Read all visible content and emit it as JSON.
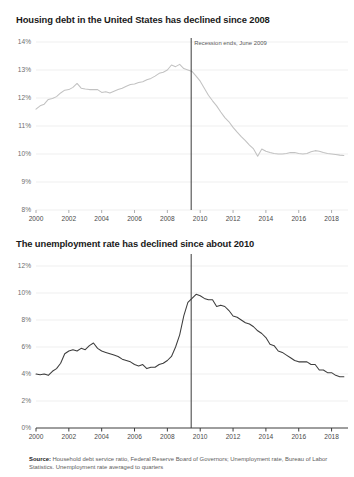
{
  "chart_data": [
    {
      "type": "line",
      "title": "Housing debt in the United States has declined since 2008",
      "xlabel": "",
      "ylabel": "",
      "xlim": [
        2000,
        2019
      ],
      "ylim": [
        8,
        14
      ],
      "ytick_labels": [
        "14%",
        "13%",
        "12%",
        "11%",
        "10%",
        "9%",
        "8%"
      ],
      "ytick_values": [
        14,
        13,
        12,
        11,
        10,
        9,
        8
      ],
      "xtick_labels": [
        "2000",
        "2002",
        "2004",
        "2006",
        "2008",
        "2010",
        "2012",
        "2014",
        "2016",
        "2018"
      ],
      "xtick_values": [
        2000,
        2002,
        2004,
        2006,
        2008,
        2010,
        2012,
        2014,
        2016,
        2018
      ],
      "grid": true,
      "legend": "none",
      "line_color": "#c2c2c2",
      "annotation": {
        "label": "Recession ends, June 2009",
        "x": 2009.45
      },
      "series": [
        {
          "name": "Household debt service ratio",
          "x": [
            2000.0,
            2000.25,
            2000.5,
            2000.75,
            2001.0,
            2001.25,
            2001.5,
            2001.75,
            2002.0,
            2002.25,
            2002.5,
            2002.75,
            2003.0,
            2003.25,
            2003.5,
            2003.75,
            2004.0,
            2004.25,
            2004.5,
            2004.75,
            2005.0,
            2005.25,
            2005.5,
            2005.75,
            2006.0,
            2006.25,
            2006.5,
            2006.75,
            2007.0,
            2007.25,
            2007.5,
            2007.75,
            2008.0,
            2008.25,
            2008.5,
            2008.75,
            2009.0,
            2009.25,
            2009.5,
            2009.75,
            2010.0,
            2010.25,
            2010.5,
            2010.75,
            2011.0,
            2011.25,
            2011.5,
            2011.75,
            2012.0,
            2012.25,
            2012.5,
            2012.75,
            2013.0,
            2013.25,
            2013.5,
            2013.75,
            2014.0,
            2014.25,
            2014.5,
            2014.75,
            2015.0,
            2015.25,
            2015.5,
            2015.75,
            2016.0,
            2016.25,
            2016.5,
            2016.75,
            2017.0,
            2017.25,
            2017.5,
            2017.75,
            2018.0,
            2018.25,
            2018.5,
            2018.75
          ],
          "values": [
            11.6,
            11.72,
            11.78,
            11.95,
            11.98,
            12.05,
            12.18,
            12.28,
            12.3,
            12.38,
            12.52,
            12.35,
            12.32,
            12.3,
            12.3,
            12.3,
            12.2,
            12.22,
            12.18,
            12.24,
            12.3,
            12.35,
            12.42,
            12.48,
            12.5,
            12.55,
            12.58,
            12.65,
            12.7,
            12.78,
            12.88,
            12.92,
            13.0,
            13.18,
            13.12,
            13.2,
            13.05,
            13.0,
            12.95,
            12.78,
            12.6,
            12.35,
            12.1,
            11.9,
            11.72,
            11.5,
            11.3,
            11.15,
            10.95,
            10.78,
            10.62,
            10.48,
            10.32,
            10.18,
            9.92,
            10.18,
            10.1,
            10.05,
            10.02,
            10.0,
            10.0,
            10.02,
            10.05,
            10.05,
            10.02,
            10.0,
            10.02,
            10.08,
            10.12,
            10.1,
            10.05,
            10.02,
            10.0,
            9.98,
            9.96,
            9.95
          ]
        }
      ]
    },
    {
      "type": "line",
      "title": "The unemployment rate has declined since about 2010",
      "xlabel": "",
      "ylabel": "",
      "xlim": [
        2000,
        2019
      ],
      "ylim": [
        0,
        12
      ],
      "ytick_labels": [
        "12%",
        "10%",
        "8%",
        "6%",
        "4%",
        "2%",
        "0%"
      ],
      "ytick_values": [
        12,
        10,
        8,
        6,
        4,
        2,
        0
      ],
      "xtick_labels": [
        "2000",
        "2002",
        "2004",
        "2006",
        "2008",
        "2010",
        "2012",
        "2014",
        "2016",
        "2018"
      ],
      "xtick_values": [
        2000,
        2002,
        2004,
        2006,
        2008,
        2010,
        2012,
        2014,
        2016,
        2018
      ],
      "grid": true,
      "legend": "none",
      "line_color": "#3d3d3d",
      "annotation": {
        "label": "",
        "x": 2009.45
      },
      "series": [
        {
          "name": "Unemployment rate",
          "x": [
            2000.0,
            2000.25,
            2000.5,
            2000.75,
            2001.0,
            2001.25,
            2001.5,
            2001.75,
            2002.0,
            2002.25,
            2002.5,
            2002.75,
            2003.0,
            2003.25,
            2003.5,
            2003.75,
            2004.0,
            2004.25,
            2004.5,
            2004.75,
            2005.0,
            2005.25,
            2005.5,
            2005.75,
            2006.0,
            2006.25,
            2006.5,
            2006.75,
            2007.0,
            2007.25,
            2007.5,
            2007.75,
            2008.0,
            2008.25,
            2008.5,
            2008.75,
            2009.0,
            2009.25,
            2009.5,
            2009.75,
            2010.0,
            2010.25,
            2010.5,
            2010.75,
            2011.0,
            2011.25,
            2011.5,
            2011.75,
            2012.0,
            2012.25,
            2012.5,
            2012.75,
            2013.0,
            2013.25,
            2013.5,
            2013.75,
            2014.0,
            2014.25,
            2014.5,
            2014.75,
            2015.0,
            2015.25,
            2015.5,
            2015.75,
            2016.0,
            2016.25,
            2016.5,
            2016.75,
            2017.0,
            2017.25,
            2017.5,
            2017.75,
            2018.0,
            2018.25,
            2018.5,
            2018.75
          ],
          "values": [
            4.0,
            3.95,
            4.0,
            3.9,
            4.2,
            4.4,
            4.8,
            5.5,
            5.7,
            5.8,
            5.7,
            5.9,
            5.8,
            6.1,
            6.3,
            5.9,
            5.7,
            5.6,
            5.5,
            5.4,
            5.3,
            5.1,
            5.0,
            4.9,
            4.7,
            4.6,
            4.7,
            4.4,
            4.5,
            4.5,
            4.7,
            4.8,
            5.0,
            5.3,
            6.0,
            6.9,
            8.3,
            9.3,
            9.6,
            9.9,
            9.8,
            9.6,
            9.5,
            9.5,
            9.0,
            9.1,
            9.0,
            8.7,
            8.3,
            8.2,
            8.0,
            7.8,
            7.7,
            7.5,
            7.2,
            7.0,
            6.7,
            6.2,
            6.1,
            5.7,
            5.6,
            5.4,
            5.2,
            5.0,
            4.9,
            4.9,
            4.9,
            4.7,
            4.7,
            4.3,
            4.3,
            4.1,
            4.1,
            3.9,
            3.8,
            3.8
          ]
        }
      ]
    }
  ],
  "source": {
    "label": "Source:",
    "text": " Household debt service ratio, Federal Reserve Board of Governors; Unemployment rate, Bureau of Labor Statistics. Unemployment rate averaged to quarters"
  }
}
